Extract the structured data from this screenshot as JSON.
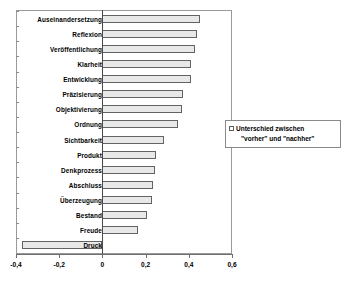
{
  "chart_data": {
    "type": "bar",
    "orientation": "horizontal",
    "title": "",
    "xlabel": "",
    "ylabel": "",
    "xlim": [
      -0.4,
      0.6
    ],
    "grid": false,
    "legend_position": "right",
    "xticks": [
      "-0,4",
      "-0,2",
      "0",
      "0,2",
      "0,4",
      "0,6"
    ],
    "xtick_values": [
      -0.4,
      -0.2,
      0,
      0.2,
      0.4,
      0.6
    ],
    "categories": [
      "Auseinandersetzung",
      "Reflexion",
      "Veröffentlichung",
      "Klarheit",
      "Entwicklung",
      "Präzisierung",
      "Objektivierung",
      "Ordnung",
      "Sichtbarkeit",
      "Produkt",
      "Denkprozess",
      "Abschluss",
      "Überzeugung",
      "Bestand",
      "Freude",
      "Druck"
    ],
    "values": [
      0.45,
      0.44,
      0.43,
      0.41,
      0.41,
      0.375,
      0.37,
      0.35,
      0.285,
      0.25,
      0.245,
      0.235,
      0.23,
      0.205,
      0.165,
      -0.37
    ],
    "series": [
      {
        "name": "Unterschied zwischen \"vorher\" und \"nachher\"",
        "values": [
          0.45,
          0.44,
          0.43,
          0.41,
          0.41,
          0.375,
          0.37,
          0.35,
          0.285,
          0.25,
          0.245,
          0.235,
          0.23,
          0.205,
          0.165,
          -0.37
        ]
      }
    ],
    "colors": {
      "bar_fill": "#e8e8e8",
      "bar_border": "#636363",
      "axis": "#6f6f6f",
      "frame": "#9a9a9a",
      "text": "#000000"
    }
  },
  "legend": {
    "line1": "Unterschied zwischen",
    "line2": "\"vorher\" und \"nachher\""
  }
}
